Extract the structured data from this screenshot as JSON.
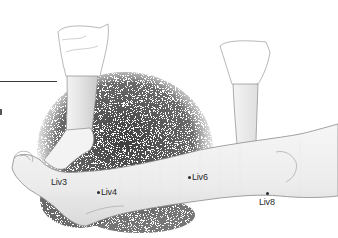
{
  "figure": {
    "colors": {
      "background": "#ffffff",
      "shading": "#6e6e6e",
      "skin": "#f2f2f2",
      "outline": "#8a8a8a",
      "label": "#2a2a2a"
    }
  },
  "points": [
    {
      "id": "liv3",
      "label": "Liv3",
      "dot": false,
      "label_x": 51,
      "label_y": 178
    },
    {
      "id": "liv4",
      "label": "Liv4",
      "dot": true,
      "dot_x": 98,
      "dot_y": 192,
      "label_x": 102,
      "label_y": 188
    },
    {
      "id": "liv6",
      "label": "Liv6",
      "dot": true,
      "dot_x": 189,
      "dot_y": 177,
      "label_x": 193,
      "label_y": 173
    },
    {
      "id": "liv8",
      "label": "Liv8",
      "dot": true,
      "dot_x": 267,
      "dot_y": 193,
      "label_x": 259,
      "label_y": 198
    }
  ]
}
